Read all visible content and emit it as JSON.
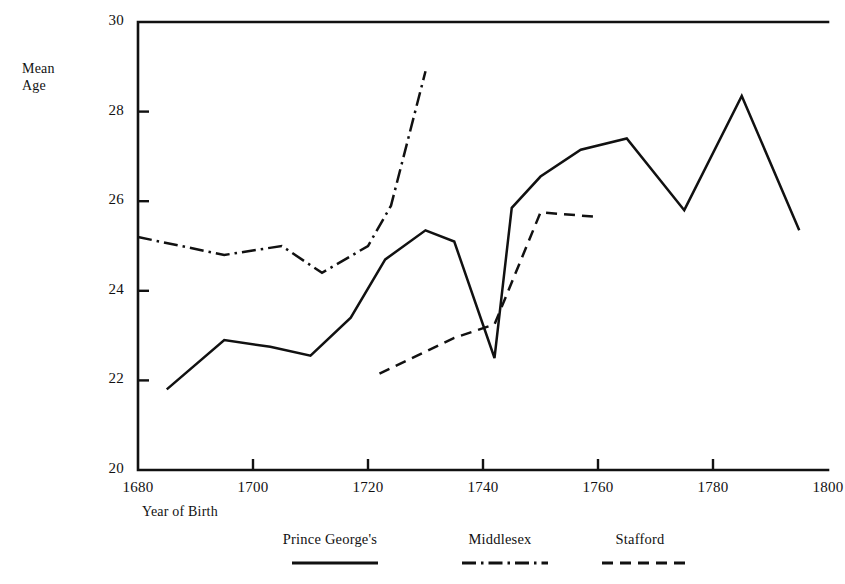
{
  "chart_data": {
    "type": "line",
    "title": "",
    "xlabel": "Year of Birth",
    "ylabel": "Mean\nAge",
    "xlim": [
      1680,
      1800
    ],
    "ylim": [
      20,
      30
    ],
    "xticks": [
      1680,
      1700,
      1720,
      1740,
      1760,
      1780,
      1800
    ],
    "xtick_labels": [
      "1680",
      "1700",
      "1720",
      "1740",
      "1760",
      "1780",
      "1800"
    ],
    "yticks": [
      20,
      22,
      24,
      26,
      28,
      30
    ],
    "ytick_labels": [
      "20",
      "22",
      "24",
      "26",
      "28",
      "30"
    ],
    "grid": false,
    "legend_position": "below-axes",
    "series": [
      {
        "name": "Prince George's",
        "style": "solid",
        "color": "#111111",
        "x": [
          1685,
          1695,
          1703,
          1710,
          1717,
          1723,
          1730,
          1735,
          1742,
          1745,
          1750,
          1757,
          1765,
          1775,
          1785,
          1795
        ],
        "y": [
          21.8,
          22.9,
          22.75,
          22.55,
          23.4,
          24.7,
          25.35,
          25.1,
          22.5,
          25.85,
          26.55,
          27.15,
          27.4,
          25.8,
          28.35,
          25.35
        ]
      },
      {
        "name": "Middlesex",
        "style": "dashdot",
        "color": "#111111",
        "x": [
          1680,
          1695,
          1705,
          1712,
          1720,
          1724,
          1730
        ],
        "y": [
          25.2,
          24.8,
          25.0,
          24.4,
          25.0,
          25.9,
          28.9
        ]
      },
      {
        "name": "Stafford",
        "style": "dashed",
        "color": "#111111",
        "x": [
          1722,
          1735,
          1742,
          1750,
          1760
        ],
        "y": [
          22.15,
          22.95,
          23.25,
          25.75,
          25.65
        ]
      }
    ]
  },
  "legend": {
    "items": [
      {
        "label": "Prince George's",
        "style": "solid"
      },
      {
        "label": "Middlesex",
        "style": "dashdot"
      },
      {
        "label": "Stafford",
        "style": "dashed"
      }
    ]
  }
}
